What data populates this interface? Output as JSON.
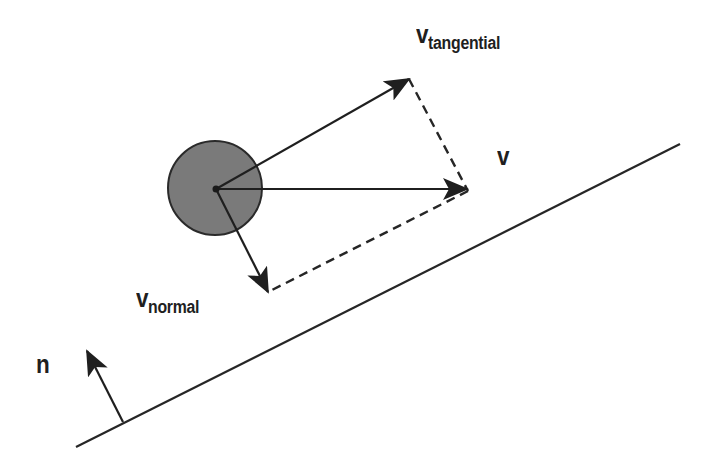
{
  "diagram": {
    "labels": {
      "v_tangential": {
        "main": "v",
        "sub": "tangential"
      },
      "v": {
        "main": "v"
      },
      "v_normal": {
        "main": "v",
        "sub": "normal"
      },
      "n": {
        "main": "n"
      }
    },
    "colors": {
      "background": "#ffffff",
      "stroke": "#262626",
      "ball_fill": "#7a7a7a",
      "ball_stroke": "#2a2a2a"
    },
    "geometry": {
      "ball": {
        "cx": 215,
        "cy": 188,
        "r": 47
      },
      "origin": {
        "x": 216,
        "y": 189
      },
      "v_tangential_tip": {
        "x": 409,
        "y": 79
      },
      "v_tip": {
        "x": 467,
        "y": 189
      },
      "v_normal_tip": {
        "x": 268,
        "y": 292
      },
      "surface": {
        "x1": 76,
        "y1": 447,
        "x2": 680,
        "y2": 144
      },
      "normal_vector": {
        "x1": 123,
        "y1": 422,
        "x2": 87,
        "y2": 351
      }
    }
  }
}
